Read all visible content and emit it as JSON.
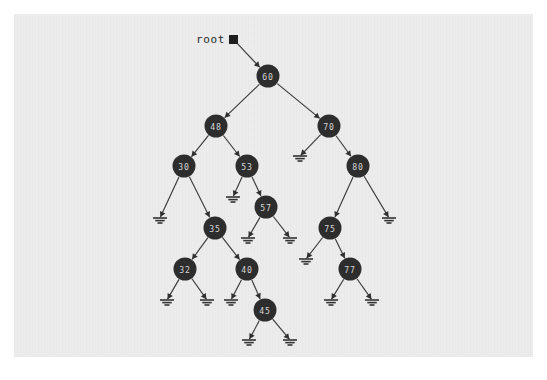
{
  "diagram": {
    "type": "binary-search-tree",
    "root_label": "root",
    "root_pointer_icon": "filled-square-pointer",
    "null_icon": "ground-symbol",
    "colors": {
      "page_background": "#ffffff",
      "canvas_background": "#ededed",
      "node_fill": "#2d2d2d",
      "node_text": "#d6d6d6",
      "edge": "#3a3a3a",
      "label_text": "#2a2a2a"
    },
    "canvas": {
      "x": 14,
      "y": 14,
      "width": 519,
      "height": 343
    },
    "root_pointer": {
      "label_x": 196,
      "label_y": 39,
      "box_x": 229,
      "box_y": 35,
      "box_size": 9
    },
    "nodes": [
      {
        "id": "n60",
        "value": "60",
        "x": 268,
        "y": 76,
        "r": 11.5
      },
      {
        "id": "n48",
        "value": "48",
        "x": 216,
        "y": 126,
        "r": 11.5
      },
      {
        "id": "n70",
        "value": "70",
        "x": 329,
        "y": 126,
        "r": 11.5
      },
      {
        "id": "n30",
        "value": "30",
        "x": 184,
        "y": 166,
        "r": 11.5
      },
      {
        "id": "n53",
        "value": "53",
        "x": 247,
        "y": 166,
        "r": 11.5
      },
      {
        "id": "n80",
        "value": "80",
        "x": 358,
        "y": 166,
        "r": 11.5
      },
      {
        "id": "n57",
        "value": "57",
        "x": 266,
        "y": 207,
        "r": 11.5
      },
      {
        "id": "n35",
        "value": "35",
        "x": 215,
        "y": 228,
        "r": 11.5
      },
      {
        "id": "n75",
        "value": "75",
        "x": 330,
        "y": 228,
        "r": 11.5
      },
      {
        "id": "n32",
        "value": "32",
        "x": 185,
        "y": 269,
        "r": 11.5
      },
      {
        "id": "n40",
        "value": "40",
        "x": 247,
        "y": 269,
        "r": 11.5
      },
      {
        "id": "n77",
        "value": "77",
        "x": 350,
        "y": 269,
        "r": 11.5
      },
      {
        "id": "n45",
        "value": "45",
        "x": 265,
        "y": 310,
        "r": 11.5
      }
    ],
    "nulls": [
      {
        "id": "null-70-left",
        "x": 300,
        "y": 156
      },
      {
        "id": "null-53-left",
        "x": 233,
        "y": 197
      },
      {
        "id": "null-30-left",
        "x": 160,
        "y": 218
      },
      {
        "id": "null-80-right",
        "x": 389,
        "y": 218
      },
      {
        "id": "null-57-left",
        "x": 248,
        "y": 238
      },
      {
        "id": "null-57-right",
        "x": 290,
        "y": 238
      },
      {
        "id": "null-75-left",
        "x": 306,
        "y": 259
      },
      {
        "id": "null-32-left",
        "x": 167,
        "y": 300
      },
      {
        "id": "null-32-right",
        "x": 207,
        "y": 300
      },
      {
        "id": "null-40-left",
        "x": 231,
        "y": 300
      },
      {
        "id": "null-77-left",
        "x": 331,
        "y": 300
      },
      {
        "id": "null-77-right",
        "x": 372,
        "y": 300
      },
      {
        "id": "null-45-left",
        "x": 249,
        "y": 340
      },
      {
        "id": "null-45-right",
        "x": 290,
        "y": 340
      }
    ],
    "edges": [
      {
        "id": "edge-root-60",
        "from": "root-pointer",
        "to": "n60",
        "type": "pointer"
      },
      {
        "id": "edge-60-48",
        "from": "n60",
        "to": "n48",
        "type": "child"
      },
      {
        "id": "edge-60-70",
        "from": "n60",
        "to": "n70",
        "type": "child"
      },
      {
        "id": "edge-48-30",
        "from": "n48",
        "to": "n30",
        "type": "child"
      },
      {
        "id": "edge-48-53",
        "from": "n48",
        "to": "n53",
        "type": "child"
      },
      {
        "id": "edge-70-null",
        "from": "n70",
        "to": "null-70-left",
        "type": "null"
      },
      {
        "id": "edge-70-80",
        "from": "n70",
        "to": "n80",
        "type": "child"
      },
      {
        "id": "edge-30-null",
        "from": "n30",
        "to": "null-30-left",
        "type": "null"
      },
      {
        "id": "edge-30-35",
        "from": "n30",
        "to": "n35",
        "type": "child"
      },
      {
        "id": "edge-53-null",
        "from": "n53",
        "to": "null-53-left",
        "type": "null"
      },
      {
        "id": "edge-53-57",
        "from": "n53",
        "to": "n57",
        "type": "child"
      },
      {
        "id": "edge-80-75",
        "from": "n80",
        "to": "n75",
        "type": "child"
      },
      {
        "id": "edge-80-null",
        "from": "n80",
        "to": "null-80-right",
        "type": "null"
      },
      {
        "id": "edge-57-nullL",
        "from": "n57",
        "to": "null-57-left",
        "type": "null"
      },
      {
        "id": "edge-57-nullR",
        "from": "n57",
        "to": "null-57-right",
        "type": "null"
      },
      {
        "id": "edge-35-32",
        "from": "n35",
        "to": "n32",
        "type": "child"
      },
      {
        "id": "edge-35-40",
        "from": "n35",
        "to": "n40",
        "type": "child"
      },
      {
        "id": "edge-75-null",
        "from": "n75",
        "to": "null-75-left",
        "type": "null"
      },
      {
        "id": "edge-75-77",
        "from": "n75",
        "to": "n77",
        "type": "child"
      },
      {
        "id": "edge-32-nullL",
        "from": "n32",
        "to": "null-32-left",
        "type": "null"
      },
      {
        "id": "edge-32-nullR",
        "from": "n32",
        "to": "null-32-right",
        "type": "null"
      },
      {
        "id": "edge-40-null",
        "from": "n40",
        "to": "null-40-left",
        "type": "null"
      },
      {
        "id": "edge-40-45",
        "from": "n40",
        "to": "n45",
        "type": "child"
      },
      {
        "id": "edge-77-nullL",
        "from": "n77",
        "to": "null-77-left",
        "type": "null"
      },
      {
        "id": "edge-77-nullR",
        "from": "n77",
        "to": "null-77-right",
        "type": "null"
      },
      {
        "id": "edge-45-nullL",
        "from": "n45",
        "to": "null-45-left",
        "type": "null"
      },
      {
        "id": "edge-45-nullR",
        "from": "n45",
        "to": "null-45-right",
        "type": "null"
      }
    ]
  }
}
